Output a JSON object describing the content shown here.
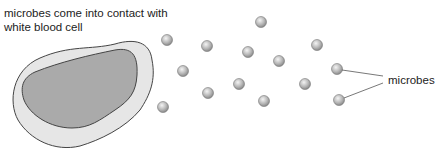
{
  "diagram": {
    "title_line1": "microbes come into contact with",
    "title_line2": "white blood cell",
    "microbes_label": "microbes",
    "colors": {
      "cell_outer": "#e6e6e6",
      "cell_inner": "#a9a9a9",
      "outline": "#444444",
      "microbe": "#b5b5b5"
    },
    "microbe_positions": [
      [
        167,
        40
      ],
      [
        261,
        22
      ],
      [
        207,
        46
      ],
      [
        248,
        52
      ],
      [
        279,
        61
      ],
      [
        183,
        71
      ],
      [
        239,
        84
      ],
      [
        208,
        93
      ],
      [
        264,
        101
      ],
      [
        163,
        107
      ],
      [
        317,
        45
      ],
      [
        337,
        69
      ],
      [
        305,
        84
      ],
      [
        339,
        100
      ]
    ]
  }
}
